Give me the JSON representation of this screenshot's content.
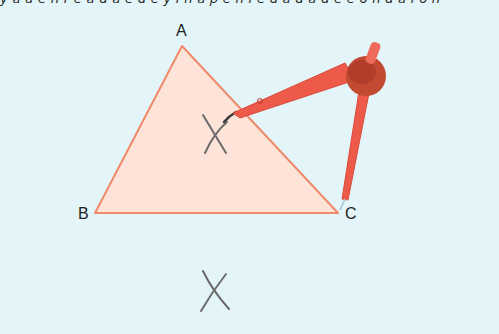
{
  "header": {
    "cut_off_text": "y a u e   n  r   e a  d  a  e  d  e  y  i  n  a  p     e   n  i  e  d  a   d  a  d  e  e  o  n  d  a  i  o  n"
  },
  "diagram": {
    "vertices": [
      {
        "label": "A",
        "x": 182,
        "y": 46
      },
      {
        "label": "B",
        "x": 95,
        "y": 213
      },
      {
        "label": "C",
        "x": 338,
        "y": 213
      }
    ],
    "triangle": {
      "fill": "#fde3d8",
      "stroke": "#f08a6a"
    },
    "arc_marks": [
      {
        "name": "upper-intersection",
        "x": 214,
        "y": 133
      },
      {
        "name": "lower-intersection",
        "x": 212,
        "y": 290
      }
    ],
    "compass": {
      "color": "#ee5a4a",
      "dark_color": "#b8402f",
      "head_color": "#c24a32",
      "pivot_point": "C",
      "pencil_tip_near": "upper-intersection"
    },
    "colors": {
      "background": "#e3f5f8",
      "arc_stroke": "#6b6b6b",
      "label_text": "#222222"
    }
  }
}
